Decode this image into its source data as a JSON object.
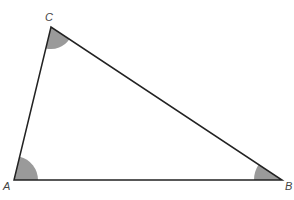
{
  "diagram": {
    "type": "triangle",
    "vertices": {
      "A": {
        "label": "A",
        "x": 14,
        "y": 180,
        "label_x": 3,
        "label_y": 190,
        "arc_radius": 24
      },
      "B": {
        "label": "B",
        "x": 282,
        "y": 180,
        "label_x": 285,
        "label_y": 190,
        "arc_radius": 28
      },
      "C": {
        "label": "C",
        "x": 51,
        "y": 27,
        "label_x": 45,
        "label_y": 21,
        "arc_radius": 22
      }
    },
    "colors": {
      "edge": "#222222",
      "angle_fill": "#9a9a9a",
      "label": "#444444",
      "background": "#ffffff"
    },
    "edge_width": 1.5
  }
}
